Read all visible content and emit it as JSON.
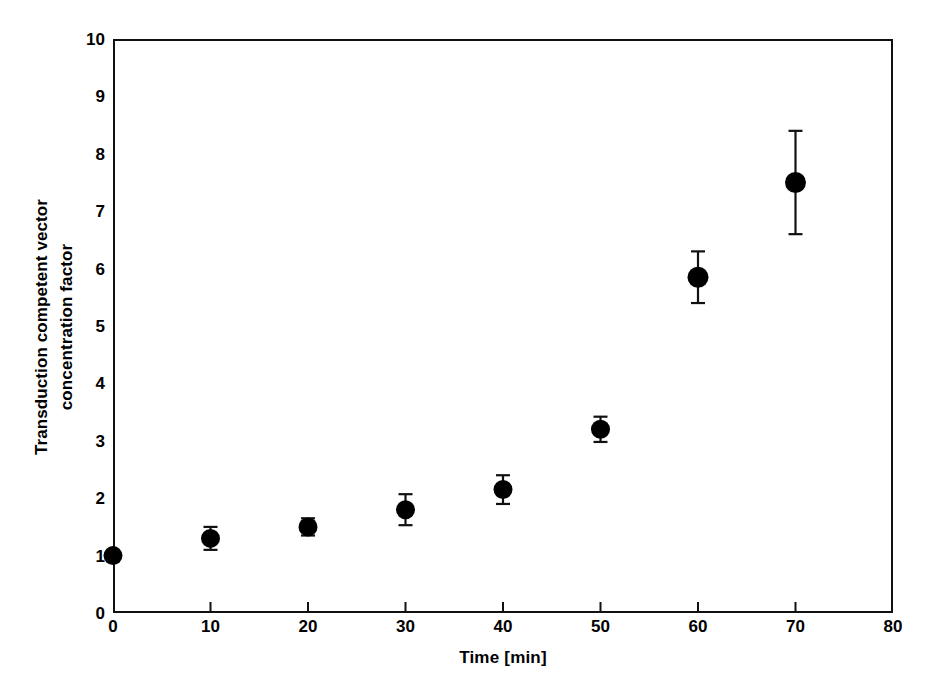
{
  "chart_data": {
    "type": "scatter",
    "title": "",
    "xlabel": "Time [min]",
    "ylabel_line1": "Transduction competent vector",
    "ylabel_line2": "concentration factor",
    "ylabel": "Transduction competent vector concentration factor",
    "xlim": [
      0,
      80
    ],
    "ylim": [
      0,
      10
    ],
    "xticks": [
      0,
      10,
      20,
      30,
      40,
      50,
      60,
      70,
      80
    ],
    "xtick_labels": [
      "0",
      "10",
      "20",
      "30",
      "40",
      "50",
      "60",
      "70",
      "80"
    ],
    "yticks": [
      0,
      1,
      2,
      3,
      4,
      5,
      6,
      7,
      8,
      9,
      10
    ],
    "ytick_labels": [
      "0",
      "1",
      "2",
      "3",
      "4",
      "5",
      "6",
      "7",
      "8",
      "9",
      "10"
    ],
    "grid": false,
    "legend": null,
    "marker": "filled-circle",
    "marker_color": "#000000",
    "errorbar_color": "#000000",
    "x": [
      0,
      10,
      20,
      30,
      40,
      50,
      60,
      70
    ],
    "values": [
      1.0,
      1.3,
      1.5,
      1.8,
      2.15,
      3.2,
      5.85,
      7.5
    ],
    "yerr": [
      0.0,
      0.2,
      0.15,
      0.27,
      0.25,
      0.22,
      0.45,
      0.9
    ],
    "series": [
      {
        "name": "Transduction competent vector concentration factor",
        "points": [
          {
            "x": 0,
            "y": 1.0,
            "err": 0.0
          },
          {
            "x": 10,
            "y": 1.3,
            "err": 0.2
          },
          {
            "x": 20,
            "y": 1.5,
            "err": 0.15
          },
          {
            "x": 30,
            "y": 1.8,
            "err": 0.27
          },
          {
            "x": 40,
            "y": 2.15,
            "err": 0.25
          },
          {
            "x": 50,
            "y": 3.2,
            "err": 0.22
          },
          {
            "x": 60,
            "y": 5.85,
            "err": 0.45
          },
          {
            "x": 70,
            "y": 7.5,
            "err": 0.9
          }
        ]
      }
    ]
  }
}
